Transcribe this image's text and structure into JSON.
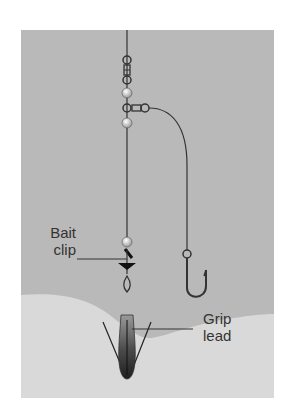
{
  "diagram": {
    "caption_fragment": "",
    "labels": {
      "bait_clip": [
        "Bait",
        "clip"
      ],
      "grip_lead": [
        "Grip",
        "lead"
      ]
    },
    "colors": {
      "water": "#b9b9b9",
      "seabed": "#d9d9d9",
      "line": "#333333",
      "bead": "#e8e8e8",
      "lead_dark": "#2a2a2a",
      "lead_light": "#8a8a8a"
    },
    "components": [
      "main-line",
      "swivel",
      "beads",
      "three-way-swivel",
      "hook-snood",
      "hook",
      "bait-clip",
      "grip-lead",
      "seabed"
    ]
  }
}
